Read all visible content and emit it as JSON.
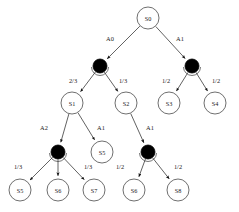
{
  "diagram": {
    "colors": {
      "state_fill": "#ffffff",
      "state_stroke": "#4a4a4a",
      "chance_fill": "#000000",
      "edge": "#3a3a3a",
      "text": "#1a1a1a",
      "background": "#ffffff"
    },
    "state_nodes": [
      {
        "id": "s0",
        "label": "S0",
        "x": 148,
        "y": 18,
        "r": 11
      },
      {
        "id": "s1",
        "label": "S1",
        "x": 72,
        "y": 103,
        "r": 11
      },
      {
        "id": "s2",
        "label": "S2",
        "x": 126,
        "y": 103,
        "r": 11
      },
      {
        "id": "s3",
        "label": "S3",
        "x": 169,
        "y": 103,
        "r": 11
      },
      {
        "id": "s4",
        "label": "S4",
        "x": 215,
        "y": 103,
        "r": 11
      },
      {
        "id": "s5mid",
        "label": "S5",
        "x": 102,
        "y": 152,
        "r": 11
      },
      {
        "id": "l1",
        "label": "S5",
        "x": 20,
        "y": 190,
        "r": 11
      },
      {
        "id": "l2",
        "label": "S6",
        "x": 58,
        "y": 190,
        "r": 11
      },
      {
        "id": "l3",
        "label": "S7",
        "x": 94,
        "y": 190,
        "r": 11
      },
      {
        "id": "l4",
        "label": "S6",
        "x": 134,
        "y": 190,
        "r": 11
      },
      {
        "id": "l5",
        "label": "S8",
        "x": 178,
        "y": 190,
        "r": 11
      }
    ],
    "chance_nodes": [
      {
        "id": "c1",
        "x": 100,
        "y": 66,
        "r": 7
      },
      {
        "id": "c2",
        "x": 192,
        "y": 66,
        "r": 7
      },
      {
        "id": "c3",
        "x": 58,
        "y": 152,
        "r": 7
      },
      {
        "id": "c4",
        "x": 148,
        "y": 152,
        "r": 7
      }
    ],
    "edges": [
      {
        "id": "e-s0-c1",
        "from": "s0",
        "to": "c1",
        "label": "A0",
        "label_x": 110,
        "label_y": 38
      },
      {
        "id": "e-s0-c2",
        "from": "s0",
        "to": "c2",
        "label": "A1",
        "label_x": 180,
        "label_y": 38
      },
      {
        "id": "e-c1-s1",
        "from": "c1",
        "to": "s1",
        "label": "2/3",
        "label_x": 73,
        "label_y": 80
      },
      {
        "id": "e-c1-s2",
        "from": "c1",
        "to": "s2",
        "label": "1/3",
        "label_x": 123,
        "label_y": 80
      },
      {
        "id": "e-c2-s3",
        "from": "c2",
        "to": "s3",
        "label": "1/2",
        "label_x": 166,
        "label_y": 80
      },
      {
        "id": "e-c2-s4",
        "from": "c2",
        "to": "s4",
        "label": "1/2",
        "label_x": 216,
        "label_y": 80
      },
      {
        "id": "e-s1-c3",
        "from": "s1",
        "to": "c3",
        "label": "A2",
        "label_x": 44,
        "label_y": 127
      },
      {
        "id": "e-s1-s5",
        "from": "s1",
        "to": "s5mid",
        "label": "A1",
        "label_x": 101,
        "label_y": 127
      },
      {
        "id": "e-s2-c4",
        "from": "s2",
        "to": "c4",
        "label": "A1",
        "label_x": 150,
        "label_y": 127
      },
      {
        "id": "e-c3-l1",
        "from": "c3",
        "to": "l1",
        "label": "1/3",
        "label_x": 18,
        "label_y": 166
      },
      {
        "id": "e-c3-l2",
        "from": "c3",
        "to": "l2",
        "label": "",
        "label_x": 58,
        "label_y": 166
      },
      {
        "id": "e-c3-l3",
        "from": "c3",
        "to": "l3",
        "label": "1/3",
        "label_x": 88,
        "label_y": 166
      },
      {
        "id": "e-c4-l4",
        "from": "c4",
        "to": "l4",
        "label": "1/2",
        "label_x": 120,
        "label_y": 166
      },
      {
        "id": "e-c4-l5",
        "from": "c4",
        "to": "l5",
        "label": "1/2",
        "label_x": 178,
        "label_y": 166
      }
    ]
  }
}
